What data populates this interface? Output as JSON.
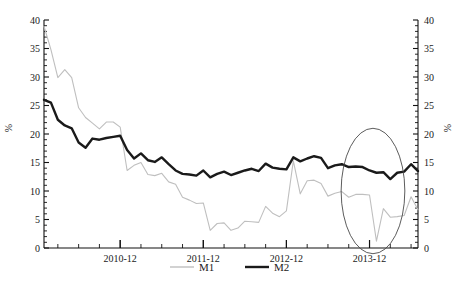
{
  "chart_data": {
    "type": "line",
    "title": "",
    "xlabel": "",
    "ylabel": "%",
    "ylabel_right": "%",
    "ylim": [
      0,
      40
    ],
    "ytick_step": 5,
    "yticks": [
      0,
      5,
      10,
      15,
      20,
      25,
      30,
      35,
      40
    ],
    "ytick_labels": [
      "0",
      "5",
      "10",
      "15",
      "20",
      "25",
      "30",
      "35",
      "40"
    ],
    "yticks_right": [
      0,
      5,
      10,
      15,
      20,
      25,
      30,
      35,
      40
    ],
    "ytick_labels_right": [
      "0",
      "5",
      "10",
      "15",
      "20",
      "25",
      "30",
      "35",
      "40"
    ],
    "minor_ticks_per_major": 5,
    "grid": false,
    "legend_position": "bottom-center",
    "x_tick_labels": [
      "2010-12",
      "2011-12",
      "2012-12",
      "2013-12"
    ],
    "x_tick_positions": [
      11,
      23,
      35,
      47
    ],
    "x_index_range": [
      0,
      54
    ],
    "x": [
      "2010-01",
      "2010-02",
      "2010-03",
      "2010-04",
      "2010-05",
      "2010-06",
      "2010-07",
      "2010-08",
      "2010-09",
      "2010-10",
      "2010-11",
      "2010-12",
      "2011-01",
      "2011-02",
      "2011-03",
      "2011-04",
      "2011-05",
      "2011-06",
      "2011-07",
      "2011-08",
      "2011-09",
      "2011-10",
      "2011-11",
      "2011-12",
      "2012-01",
      "2012-02",
      "2012-03",
      "2012-04",
      "2012-05",
      "2012-06",
      "2012-07",
      "2012-08",
      "2012-09",
      "2012-10",
      "2012-11",
      "2012-12",
      "2013-01",
      "2013-02",
      "2013-03",
      "2013-04",
      "2013-05",
      "2013-06",
      "2013-07",
      "2013-08",
      "2013-09",
      "2013-10",
      "2013-11",
      "2013-12",
      "2014-01",
      "2014-02",
      "2014-03",
      "2014-04",
      "2014-05",
      "2014-06",
      "2014-07"
    ],
    "series": [
      {
        "name": "M1",
        "color": "#bfbfbf",
        "style": "thin-gray",
        "values": [
          38.9,
          34.8,
          29.9,
          31.3,
          29.9,
          24.6,
          22.9,
          21.9,
          20.9,
          22.1,
          22.1,
          21.2,
          13.6,
          14.5,
          15.0,
          12.9,
          12.7,
          13.1,
          11.6,
          11.2,
          8.9,
          8.4,
          7.8,
          7.9,
          3.1,
          4.3,
          4.4,
          3.1,
          3.5,
          4.7,
          4.6,
          4.5,
          7.3,
          6.1,
          5.5,
          6.5,
          15.3,
          9.5,
          11.8,
          11.9,
          11.3,
          9.1,
          9.6,
          9.9,
          8.9,
          9.4,
          9.4,
          9.3,
          1.2,
          6.9,
          5.4,
          5.5,
          5.7,
          9.0,
          6.7
        ]
      },
      {
        "name": "M2",
        "color": "#1a1a1a",
        "style": "thick-black",
        "values": [
          26.0,
          25.5,
          22.5,
          21.5,
          21.0,
          18.5,
          17.6,
          19.2,
          19.0,
          19.3,
          19.5,
          19.7,
          17.2,
          15.7,
          16.6,
          15.4,
          15.1,
          15.9,
          14.7,
          13.6,
          13.0,
          12.9,
          12.7,
          13.6,
          12.4,
          13.0,
          13.4,
          12.8,
          13.2,
          13.6,
          13.9,
          13.5,
          14.8,
          14.1,
          13.9,
          13.8,
          15.9,
          15.2,
          15.7,
          16.1,
          15.8,
          14.0,
          14.5,
          14.7,
          14.2,
          14.3,
          14.2,
          13.6,
          13.2,
          13.3,
          12.1,
          13.2,
          13.4,
          14.7,
          13.5
        ]
      }
    ],
    "annotations": [
      {
        "type": "ellipse",
        "name": "highlight-ellipse",
        "cx_index": 47.5,
        "cy_value": 10.0,
        "rx_index": 4.6,
        "ry_value": 11.0,
        "color": "#4a4a4a"
      }
    ]
  },
  "legend": {
    "items": [
      {
        "label": "M1",
        "color": "#bfbfbf"
      },
      {
        "label": "M2",
        "color": "#1a1a1a"
      }
    ]
  },
  "axes": {
    "left_title": "%",
    "right_title": "%"
  }
}
